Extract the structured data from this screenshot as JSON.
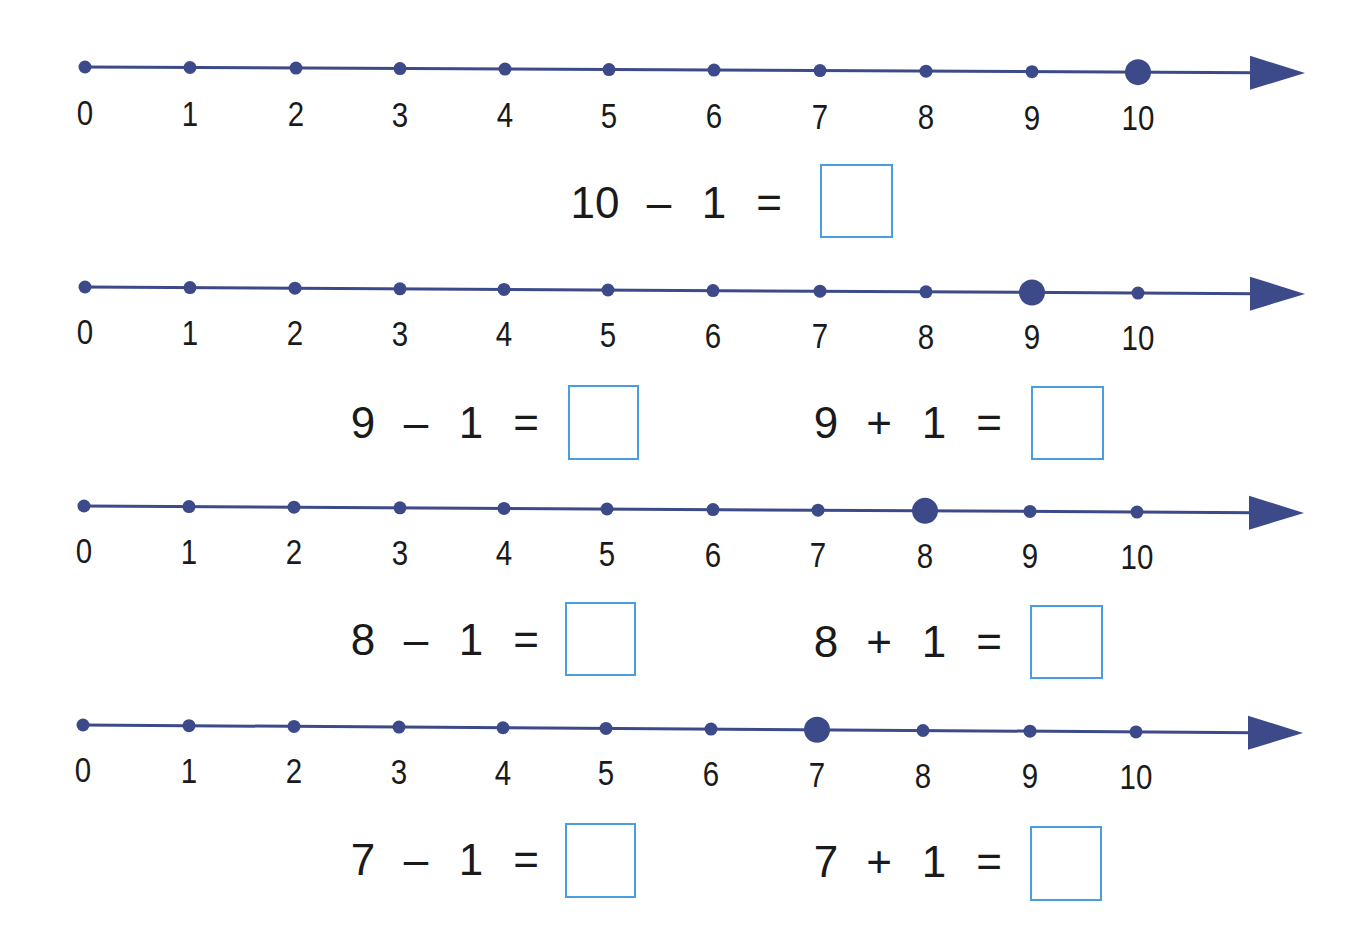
{
  "colors": {
    "line": "#3d4a8a",
    "text": "#1a1a1a",
    "answer_box_border": "#4a9ee0",
    "background": "#ffffff"
  },
  "number_lines": [
    {
      "labels": [
        "0",
        "1",
        "2",
        "3",
        "4",
        "5",
        "6",
        "7",
        "8",
        "9",
        "10"
      ],
      "highlighted": "10",
      "tick_x": [
        85,
        190,
        296,
        400,
        505,
        609,
        714,
        820,
        926,
        1032,
        1138
      ],
      "y_start": 67,
      "y_end": 73,
      "label_y": 125,
      "arrow_tip_x": 1305
    },
    {
      "labels": [
        "0",
        "1",
        "2",
        "3",
        "4",
        "5",
        "6",
        "7",
        "8",
        "9",
        "10"
      ],
      "highlighted": "9",
      "tick_x": [
        85,
        190,
        295,
        400,
        504,
        608,
        713,
        820,
        926,
        1032,
        1138
      ],
      "y_start": 287,
      "y_end": 294,
      "label_y": 344,
      "arrow_tip_x": 1305
    },
    {
      "labels": [
        "0",
        "1",
        "2",
        "3",
        "4",
        "5",
        "6",
        "7",
        "8",
        "9",
        "10"
      ],
      "highlighted": "8",
      "tick_x": [
        84,
        189,
        294,
        400,
        504,
        607,
        713,
        818,
        925,
        1030,
        1137
      ],
      "y_start": 506,
      "y_end": 513,
      "label_y": 563,
      "arrow_tip_x": 1304
    },
    {
      "labels": [
        "0",
        "1",
        "2",
        "3",
        "4",
        "5",
        "6",
        "7",
        "8",
        "9",
        "10"
      ],
      "highlighted": "7",
      "tick_x": [
        83,
        189,
        294,
        399,
        503,
        606,
        711,
        817,
        923,
        1030,
        1136
      ],
      "y_start": 725,
      "y_end": 733,
      "label_y": 782,
      "arrow_tip_x": 1303
    }
  ],
  "equations": [
    {
      "a": "10",
      "op": "–",
      "b": "1",
      "eq": "=",
      "answer": "",
      "x": 566,
      "y": 165,
      "box": {
        "x": 820,
        "y": 164,
        "w": 73,
        "h": 74
      }
    },
    {
      "a": "9",
      "op": "–",
      "b": "1",
      "eq": "=",
      "answer": "",
      "x": 345,
      "y": 385,
      "box": {
        "x": 568,
        "y": 385,
        "w": 71,
        "h": 75
      }
    },
    {
      "a": "9",
      "op": "+",
      "b": "1",
      "eq": "=",
      "answer": "",
      "x": 808,
      "y": 385,
      "box": {
        "x": 1031,
        "y": 386,
        "w": 73,
        "h": 74
      }
    },
    {
      "a": "8",
      "op": "–",
      "b": "1",
      "eq": "=",
      "answer": "",
      "x": 345,
      "y": 602,
      "box": {
        "x": 565,
        "y": 602,
        "w": 71,
        "h": 74
      }
    },
    {
      "a": "8",
      "op": "+",
      "b": "1",
      "eq": "=",
      "answer": "",
      "x": 808,
      "y": 604,
      "box": {
        "x": 1030,
        "y": 605,
        "w": 73,
        "h": 74
      }
    },
    {
      "a": "7",
      "op": "–",
      "b": "1",
      "eq": "=",
      "answer": "",
      "x": 345,
      "y": 822,
      "box": {
        "x": 565,
        "y": 823,
        "w": 71,
        "h": 75
      }
    },
    {
      "a": "7",
      "op": "+",
      "b": "1",
      "eq": "=",
      "answer": "",
      "x": 808,
      "y": 824,
      "box": {
        "x": 1030,
        "y": 826,
        "w": 72,
        "h": 75
      }
    }
  ]
}
